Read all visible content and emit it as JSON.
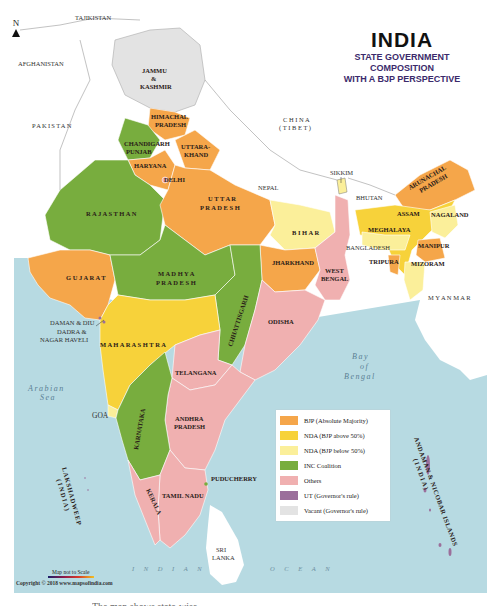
{
  "title": {
    "main": "INDIA",
    "sub_line1": "STATE GOVERNMENT COMPOSITION",
    "sub_line2": "WITH A BJP PERSPECTIVE"
  },
  "compass": {
    "label": "N",
    "icon": "north-arrow-icon"
  },
  "colors": {
    "bjp_absolute": "#f5a64a",
    "nda_above_50": "#f7d23a",
    "nda_below_50": "#fbef9a",
    "inc_coalition": "#78ad3e",
    "others": "#f0b0b0",
    "ut_governor": "#9b6f9b",
    "vacant_governor": "#e3e3e3",
    "sea": "#b7dae2",
    "foreign": "#ffffff"
  },
  "legend": {
    "items": [
      {
        "key": "bjp_absolute",
        "label": "BJP (Absolute Majority)",
        "color": "#f5a64a"
      },
      {
        "key": "nda_above_50",
        "label": "NDA (BJP above 50%)",
        "color": "#f7d23a"
      },
      {
        "key": "nda_below_50",
        "label": "NDA (BJP below 50%)",
        "color": "#fbef9a"
      },
      {
        "key": "inc_coalition",
        "label": "INC Coalition",
        "color": "#78ad3e"
      },
      {
        "key": "others",
        "label": "Others",
        "color": "#f0b0b0"
      },
      {
        "key": "ut_governor",
        "label": "UT (Governor's rule)",
        "color": "#9b6f9b"
      },
      {
        "key": "vacant_governor",
        "label": "Vacant (Governor's rule)",
        "color": "#e3e3e3"
      }
    ]
  },
  "neighbors": {
    "tajikistan": "TAJIKISTAN",
    "afghanistan": "AFGHANISTAN",
    "pakistan": "PAKISTAN",
    "china_line1": "C H I N A",
    "china_line2": "( T I B E T )",
    "nepal": "NEPAL",
    "bhutan": "BHUTAN",
    "bangladesh": "BANGLADESH",
    "myanmar": "M Y A N M A R",
    "sri_lanka_line1": "SRI",
    "sri_lanka_line2": "LANKA"
  },
  "water": {
    "arabian_line1": "Arabian",
    "arabian_line2": "Sea",
    "bay_line1": "Bay",
    "bay_line2": "of",
    "bay_line3": "Bengal",
    "indian": "I N D I A N",
    "ocean": "O C E A N"
  },
  "states": [
    {
      "name": "JAMMU & KASHMIR",
      "category": "vacant_governor"
    },
    {
      "name": "HIMACHAL PRADESH",
      "category": "bjp_absolute"
    },
    {
      "name": "PUNJAB",
      "category": "inc_coalition"
    },
    {
      "name": "CHANDIGARH",
      "category": "inc_coalition"
    },
    {
      "name": "HARYANA",
      "category": "bjp_absolute"
    },
    {
      "name": "UTTARAKHAND",
      "category": "bjp_absolute"
    },
    {
      "name": "DELHI",
      "category": "others"
    },
    {
      "name": "RAJASTHAN",
      "category": "inc_coalition"
    },
    {
      "name": "UTTAR PRADESH",
      "category": "bjp_absolute"
    },
    {
      "name": "SIKKIM",
      "category": "nda_below_50"
    },
    {
      "name": "BIHAR",
      "category": "nda_below_50"
    },
    {
      "name": "ARUNACHAL PRADESH",
      "category": "bjp_absolute"
    },
    {
      "name": "ASSAM",
      "category": "nda_above_50"
    },
    {
      "name": "NAGALAND",
      "category": "nda_below_50"
    },
    {
      "name": "MEGHALAYA",
      "category": "nda_below_50"
    },
    {
      "name": "MANIPUR",
      "category": "bjp_absolute"
    },
    {
      "name": "TRIPURA",
      "category": "bjp_absolute"
    },
    {
      "name": "MIZORAM",
      "category": "nda_below_50"
    },
    {
      "name": "GUJARAT",
      "category": "bjp_absolute"
    },
    {
      "name": "MADHYA PRADESH",
      "category": "inc_coalition"
    },
    {
      "name": "JHARKHAND",
      "category": "bjp_absolute"
    },
    {
      "name": "WEST BENGAL",
      "category": "others"
    },
    {
      "name": "CHHATTISGARH",
      "category": "inc_coalition"
    },
    {
      "name": "ODISHA",
      "category": "others"
    },
    {
      "name": "DAMAN & DIU",
      "category": "ut_governor"
    },
    {
      "name": "DADRA & NAGAR HAVELI",
      "category": "ut_governor"
    },
    {
      "name": "MAHARASHTRA",
      "category": "nda_above_50"
    },
    {
      "name": "TELANGANA",
      "category": "others"
    },
    {
      "name": "GOA",
      "category": "nda_below_50"
    },
    {
      "name": "KARNATAKA",
      "category": "inc_coalition"
    },
    {
      "name": "ANDHRA PRADESH",
      "category": "others"
    },
    {
      "name": "PUDUCHERRY",
      "category": "inc_coalition"
    },
    {
      "name": "TAMIL NADU",
      "category": "others"
    },
    {
      "name": "KERALA",
      "category": "others"
    },
    {
      "name": "LAKSHADWEEP (INDIA)",
      "category": "ut_governor"
    },
    {
      "name": "ANDAMAN & NICOBAR ISLANDS (INDIA)",
      "category": "ut_governor"
    }
  ],
  "labels": {
    "jk1": "JAMMU",
    "jk2": "&",
    "jk3": "KASHMIR",
    "hp1": "HIMACHAL",
    "hp2": "PRADESH",
    "chandigarh": "CHANDIGARH",
    "punjab": "PUNJAB",
    "uk1": "UTTARA-",
    "uk2": "KHAND",
    "haryana": "HARYANA",
    "delhi": "DELHI",
    "rajasthan": "R A J A S T H A N",
    "up1": "U T T A R",
    "up2": "P R A D E S H",
    "sikkim": "SIKKIM",
    "bihar": "B I H A R",
    "ap_ar1": "ARUNACHAL",
    "ap_ar2": "PRADESH",
    "assam": "ASSAM",
    "nagaland": "NAGALAND",
    "meghalaya": "MEGHALAYA",
    "manipur": "MANIPUR",
    "tripura": "TRIPURA",
    "mizoram": "MIZORAM",
    "gujarat": "G U J A R A T",
    "mp1": "M A D H Y A",
    "mp2": "P R A D E S H",
    "jharkhand": "JHARKHAND",
    "wb1": "WEST",
    "wb2": "BENGAL",
    "chhattisgarh": "CHHATTISGARH",
    "odisha": "ODISHA",
    "daman": "DAMAN & DIU",
    "dadra1": "DADRA &",
    "dadra2": "NAGAR HAVELI",
    "maharashtra": "M A H A R A S H T R A",
    "telangana": "TELANGANA",
    "goa": "GOA",
    "karnataka": "KARNATAKA",
    "andhra1": "ANDHRA",
    "andhra2": "PRADESH",
    "puducherry": "PUDUCHERRY",
    "tamilnadu": "TAMIL NADU",
    "kerala": "KERALA",
    "lakshadweep1": "LAKSHADWEEP",
    "lakshadweep2": "( I N D I A )",
    "andaman1": "ANDAMAN & NICOBAR ISLANDS",
    "andaman2": "( I N D I A )"
  },
  "footer": {
    "scale_note": "Map not to Scale",
    "copyright": "Copyright © 2018 www.mapsofindia.com",
    "caption_partial": "The map shows state-wise"
  }
}
